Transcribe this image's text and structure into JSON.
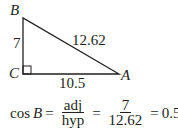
{
  "triangle": {
    "vertices": {
      "B": "B",
      "C": "C",
      "A": "A"
    },
    "sides": {
      "BC": "7",
      "BA": "12.62",
      "CA": "10.5"
    },
    "right_angle_at": "C",
    "stroke_color": "#231f20"
  },
  "equation": {
    "lhs_func": "cos",
    "lhs_var": "B",
    "eq1": "=",
    "frac1_num": "adj",
    "frac1_den": "hyp",
    "eq2": "=",
    "frac2_num": "7",
    "frac2_den": "12.62",
    "eq3": "=",
    "result": "0.5547"
  }
}
